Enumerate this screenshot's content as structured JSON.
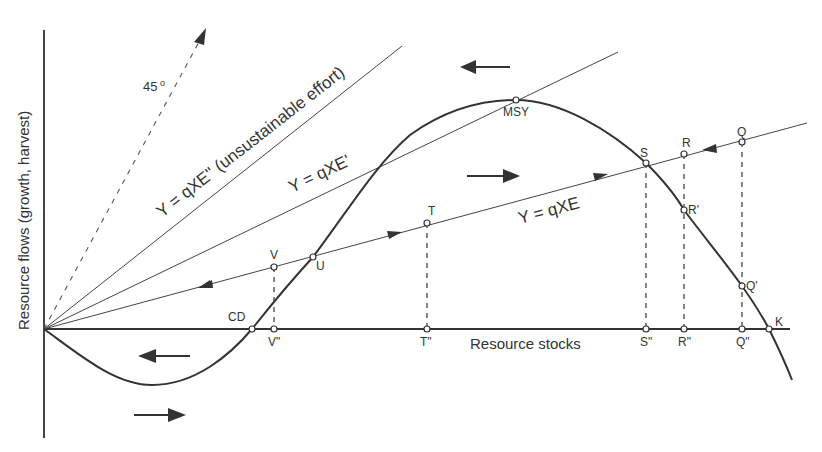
{
  "diagram": {
    "title": "",
    "axes": {
      "y_label": "Resource flows (growth, harvest)",
      "x_label": "Resource stocks"
    },
    "lines": {
      "degree45": "45",
      "degree_symbol": "o",
      "unsustainable": "Y = qXE'' (unsustainable effort)",
      "qxe_prime": "Y = qXE'",
      "qxe": "Y = qXE"
    },
    "points": {
      "msy": "MSY",
      "s": "S",
      "r": "R",
      "q": "Q",
      "r_prime": "R'",
      "q_prime": "Q'",
      "k": "K",
      "t": "T",
      "v": "V",
      "u": "U",
      "cd": "CD",
      "v_dd": "V\"",
      "t_dd": "T\"",
      "s_dd": "S\"",
      "r_dd": "R\"",
      "q_dd": "Q\""
    },
    "colors": {
      "ink": "#333333",
      "background": "#ffffff"
    }
  }
}
